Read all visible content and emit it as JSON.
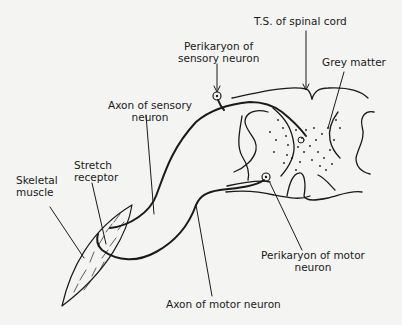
{
  "diagram": {
    "type": "anatomical-illustration",
    "colors": {
      "ink": "#1a1a1a",
      "background": "#f4f4f2"
    },
    "labels": {
      "ts_spinal_cord": {
        "line1": "T.S. of spinal cord"
      },
      "perikaryon_sensory": {
        "line1": "Perikaryon of",
        "line2": "sensory neuron"
      },
      "grey_matter": {
        "line1": "Grey matter"
      },
      "axon_sensory": {
        "line1": "Axon of sensory",
        "line2": "neuron"
      },
      "stretch_receptor": {
        "line1": "Stretch",
        "line2": "receptor"
      },
      "skeletal_muscle": {
        "line1": "Skeletal",
        "line2": "muscle"
      },
      "perikaryon_motor": {
        "line1": "Perikaryon of motor",
        "line2": "neuron"
      },
      "axon_motor": {
        "line1": "Axon of motor neuron"
      }
    }
  }
}
